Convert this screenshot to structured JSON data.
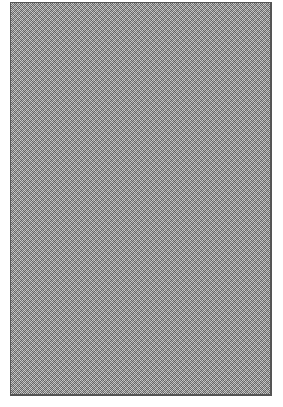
{
  "pattern": {
    "description": "gray dithered halftone fill",
    "fill_color": "#9a9a9a",
    "dark_dot_color": "#6f6f6f",
    "light_dot_color": "#c4c4c4",
    "border_color": "#555555",
    "background_color": "#ffffff"
  }
}
